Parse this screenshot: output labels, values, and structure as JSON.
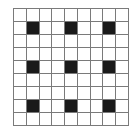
{
  "grid": {
    "rows": 9,
    "cols": 9,
    "line_color": "#7a7a7a",
    "empty_color": "#ffffff",
    "filled_color": "#1a1a1a",
    "filled_cells": [
      [
        1,
        1
      ],
      [
        1,
        4
      ],
      [
        1,
        7
      ],
      [
        4,
        1
      ],
      [
        4,
        4
      ],
      [
        4,
        7
      ],
      [
        7,
        1
      ],
      [
        7,
        4
      ],
      [
        7,
        7
      ]
    ]
  }
}
